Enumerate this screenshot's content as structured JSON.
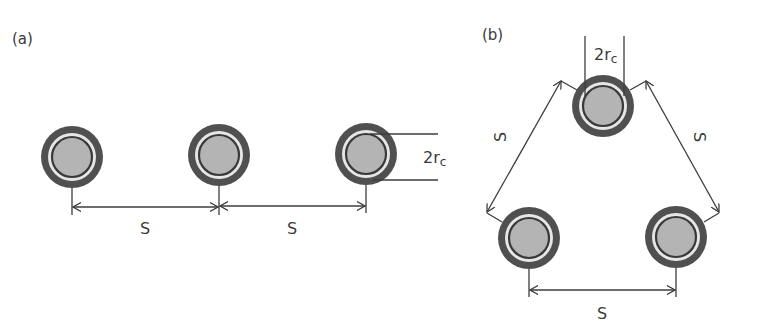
{
  "panel_a": {
    "label": "(a)",
    "spacing_labels": [
      "S",
      "S"
    ],
    "diameter_label": {
      "main": "2r",
      "sub": "c"
    },
    "cables": [
      {
        "cx": 72,
        "cy": 157
      },
      {
        "cx": 219,
        "cy": 155
      },
      {
        "cx": 366,
        "cy": 154
      }
    ]
  },
  "panel_b": {
    "label": "(b)",
    "spacing_labels": [
      "S",
      "S",
      "S"
    ],
    "diameter_label": {
      "main": "2r",
      "sub": "c"
    },
    "cables": [
      {
        "cx": 603,
        "cy": 106
      },
      {
        "cx": 529,
        "cy": 238
      },
      {
        "cx": 676,
        "cy": 237
      }
    ]
  },
  "colors": {
    "outer_sheath": "#505050",
    "insulation": "#e6e6e6",
    "conductor_ring": "#3a3a3a",
    "conductor_fill": "#b4b4b4",
    "lines": "#3c3c3c"
  }
}
